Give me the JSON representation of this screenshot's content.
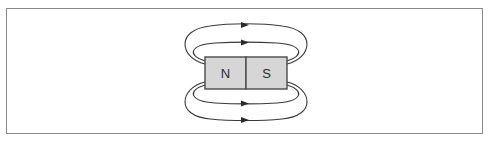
{
  "diagram": {
    "magnet": {
      "north_label": "N",
      "south_label": "S",
      "fill_color": "#d6d6d6",
      "outline_color": "#4a4a4a"
    },
    "field_lines": {
      "count": 4,
      "direction": "left-to-right (N to S) outside the magnet",
      "color": "#3a3a3a"
    },
    "frame_color": "#8a8a8a"
  }
}
